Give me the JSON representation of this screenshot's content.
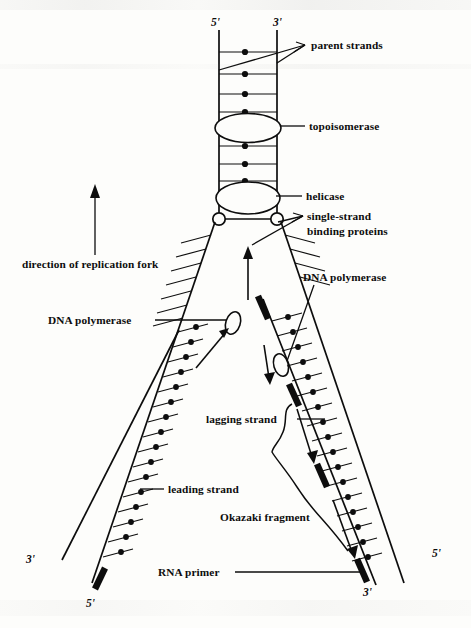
{
  "figure": {
    "background_color": "#fdfdfb",
    "ink_color": "#0d0d0d"
  },
  "labels": {
    "parent_strands": "parent strands",
    "topoisomerase": "topoisomerase",
    "helicase": "helicase",
    "ssb_line1": "single-strand",
    "ssb_line2": "binding proteins",
    "direction_of_replication_fork": "direction of replication fork",
    "dna_polymerase_left": "DNA polymerase",
    "dna_polymerase_right": "DNA polymerase",
    "lagging_strand": "lagging strand",
    "leading_strand": "leading strand",
    "okazaki_fragment": "Okazaki fragment",
    "rna_primer": "RNA primer"
  },
  "end_labels": {
    "parent_top_left": "5'",
    "parent_top_right": "3'",
    "leading_bottom_outer": "3'",
    "leading_bottom_inner": "5'",
    "lagging_bottom_inner": "3'",
    "lagging_bottom_outer": "5'"
  },
  "icons": {
    "topoisomerase": "ellipse-icon",
    "helicase": "ellipse-icon",
    "ssb_protein": "small-circle-icon",
    "dna_polymerase": "small-ellipse-icon",
    "rna_primer": "thick-bar-icon",
    "direction_arrow": "arrow-up-icon",
    "fork_arrow": "arrow-up-icon",
    "lagging_arrow": "arrow-down-icon",
    "okazaki_brace": "curly-brace-icon"
  },
  "counts": {
    "parent_rungs_upper": 4,
    "parent_rungs_lower": 3,
    "leading_rungs": 16,
    "lagging_rungs": 16,
    "rna_primers_lagging": 3,
    "rna_primers_leading": 1,
    "ssb_proteins": 2
  }
}
